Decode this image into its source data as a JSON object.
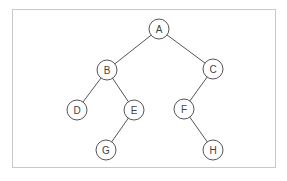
{
  "diagram": {
    "type": "binary-tree",
    "node_radius": 10,
    "nodes": [
      {
        "id": "A",
        "label": "A",
        "x": 159,
        "y": 29
      },
      {
        "id": "B",
        "label": "B",
        "x": 107,
        "y": 70
      },
      {
        "id": "C",
        "label": "C",
        "x": 213,
        "y": 69
      },
      {
        "id": "D",
        "label": "D",
        "x": 77,
        "y": 110
      },
      {
        "id": "E",
        "label": "E",
        "x": 134,
        "y": 110
      },
      {
        "id": "F",
        "label": "F",
        "x": 184,
        "y": 109
      },
      {
        "id": "G",
        "label": "G",
        "x": 106,
        "y": 150
      },
      {
        "id": "H",
        "label": "H",
        "x": 213,
        "y": 150
      }
    ],
    "edges": [
      {
        "from": "A",
        "to": "B"
      },
      {
        "from": "A",
        "to": "C"
      },
      {
        "from": "B",
        "to": "D"
      },
      {
        "from": "B",
        "to": "E"
      },
      {
        "from": "C",
        "to": "F"
      },
      {
        "from": "E",
        "to": "G"
      },
      {
        "from": "F",
        "to": "H"
      }
    ]
  }
}
